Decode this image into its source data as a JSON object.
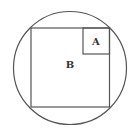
{
  "diagram": {
    "stroke_color": "#555555",
    "circle": {
      "cx": 70,
      "cy": 68,
      "r": 56.5
    },
    "square_b": {
      "x": 31,
      "y": 28,
      "size": 79,
      "label": "B"
    },
    "square_a": {
      "x": 83,
      "y": 28,
      "size": 26,
      "label": "A"
    }
  }
}
